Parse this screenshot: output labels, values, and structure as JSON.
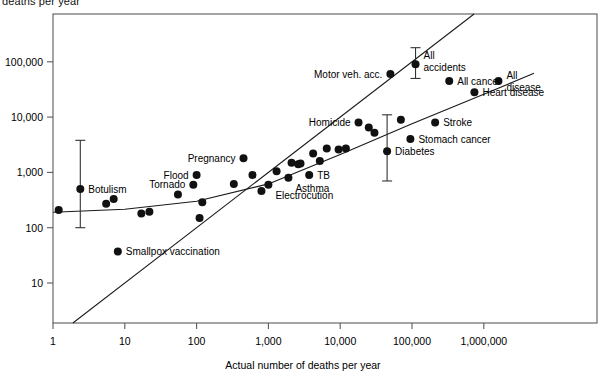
{
  "axes": {
    "ylabel": "deaths per year",
    "xlabel": "Actual number of deaths per year",
    "y_ticks": [
      "10",
      "100",
      "1,000",
      "10,000",
      "100,000"
    ],
    "x_ticks": [
      "1",
      "10",
      "100",
      "1,000",
      "10,000",
      "100,000",
      "1,000,000"
    ]
  },
  "chart_data": {
    "type": "scatter",
    "title": "",
    "xlabel": "Actual number of deaths per year",
    "ylabel": "Estimated number of deaths per year",
    "xscale": "log",
    "yscale": "log",
    "xlim": [
      1,
      10000000
    ],
    "ylim": [
      1,
      1000000
    ],
    "x_tick_values": [
      1,
      10,
      100,
      1000,
      10000,
      100000,
      1000000
    ],
    "y_tick_values": [
      10,
      100,
      1000,
      10000,
      100000
    ],
    "grid": false,
    "legend": "none",
    "annotations": [
      "Identity line (estimated = actual) drawn diagonally",
      "Fitted curve of mean judgments drawn as flattened S"
    ],
    "points": [
      {
        "label": "Smallpox vaccination",
        "actual": 8,
        "estimated": 37,
        "label_pos": "right"
      },
      {
        "label": "Botulism",
        "actual": 2.4,
        "estimated": 500,
        "label_pos": "right",
        "error_bar": {
          "low": 100,
          "high": 3800
        }
      },
      {
        "label": "Tornado",
        "actual": 90,
        "estimated": 600,
        "label_pos": "left"
      },
      {
        "label": "Flood",
        "actual": 100,
        "estimated": 900,
        "label_pos": "left"
      },
      {
        "label": "Pregnancy",
        "actual": 450,
        "estimated": 1800,
        "label_pos": "left"
      },
      {
        "label": "Electrocution",
        "actual": 1000,
        "estimated": 600,
        "label_pos": "below"
      },
      {
        "label": "Asthma",
        "actual": 1900,
        "estimated": 800,
        "label_pos": "below"
      },
      {
        "label": "TB",
        "actual": 3700,
        "estimated": 900,
        "label_pos": "right"
      },
      {
        "label": "Homicide",
        "actual": 18000,
        "estimated": 8000,
        "label_pos": "left"
      },
      {
        "label": "Motor veh. acc.",
        "actual": 50000,
        "estimated": 60000,
        "label_pos": "left"
      },
      {
        "label": "All accidents",
        "actual": 112000,
        "estimated": 90000,
        "label_pos": "right",
        "error_bar": {
          "low": 50000,
          "high": 180000
        }
      },
      {
        "label": "Diabetes",
        "actual": 45000,
        "estimated": 2400,
        "label_pos": "right",
        "error_bar": {
          "low": 700,
          "high": 11000
        }
      },
      {
        "label": "Stomach cancer",
        "actual": 95000,
        "estimated": 4000,
        "label_pos": "right"
      },
      {
        "label": "Stroke",
        "actual": 210000,
        "estimated": 8000,
        "label_pos": "right"
      },
      {
        "label": "All cancer",
        "actual": 330000,
        "estimated": 45000,
        "label_pos": "right"
      },
      {
        "label": "Heart disease",
        "actual": 740000,
        "estimated": 28000,
        "label_pos": "right"
      },
      {
        "label": "All disease",
        "actual": 1600000,
        "estimated": 45000,
        "label_pos": "right"
      }
    ],
    "unlabeled_points": [
      {
        "actual": 1.2,
        "estimated": 210
      },
      {
        "actual": 5.5,
        "estimated": 270
      },
      {
        "actual": 7,
        "estimated": 330
      },
      {
        "actual": 17,
        "estimated": 180
      },
      {
        "actual": 22,
        "estimated": 195
      },
      {
        "actual": 55,
        "estimated": 400
      },
      {
        "actual": 120,
        "estimated": 290
      },
      {
        "actual": 110,
        "estimated": 150
      },
      {
        "actual": 330,
        "estimated": 620
      },
      {
        "actual": 600,
        "estimated": 900
      },
      {
        "actual": 800,
        "estimated": 460
      },
      {
        "actual": 1300,
        "estimated": 1050
      },
      {
        "actual": 2100,
        "estimated": 1500
      },
      {
        "actual": 2600,
        "estimated": 1400
      },
      {
        "actual": 2800,
        "estimated": 1450
      },
      {
        "actual": 4200,
        "estimated": 2200
      },
      {
        "actual": 5200,
        "estimated": 1600
      },
      {
        "actual": 6500,
        "estimated": 2700
      },
      {
        "actual": 9500,
        "estimated": 2600
      },
      {
        "actual": 12000,
        "estimated": 2700
      },
      {
        "actual": 25000,
        "estimated": 6500
      },
      {
        "actual": 30000,
        "estimated": 5200
      },
      {
        "actual": 70000,
        "estimated": 9000
      }
    ]
  }
}
